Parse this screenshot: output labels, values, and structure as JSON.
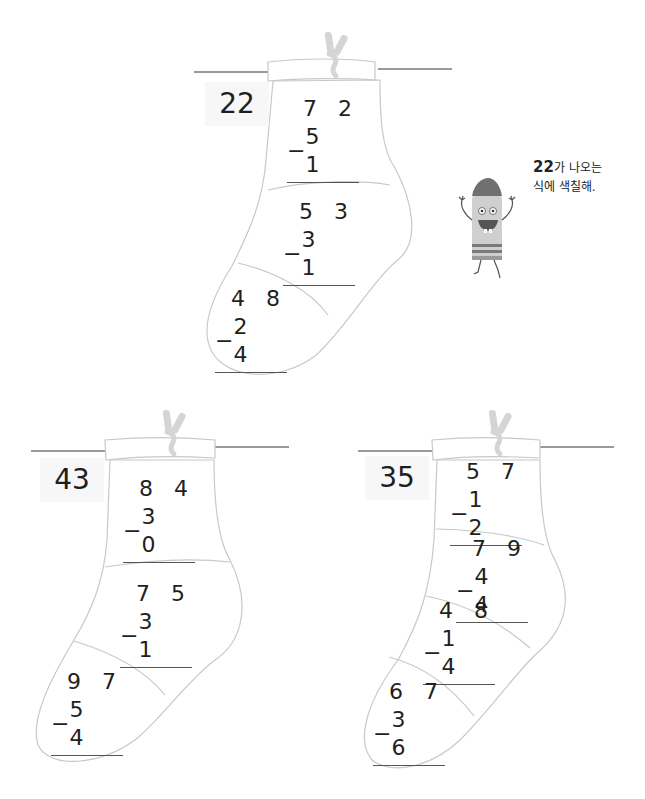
{
  "instruction": {
    "target": "22",
    "line1_suffix": "가 나오는",
    "line2": "식에 색칠해."
  },
  "stockings": [
    {
      "answer": "22",
      "problems": [
        {
          "minuend": "7 2",
          "operator": "−",
          "subtrahend": "5 1"
        },
        {
          "minuend": "5 3",
          "operator": "−",
          "subtrahend": "3 1"
        },
        {
          "minuend": "4 8",
          "operator": "−",
          "subtrahend": "2 4"
        }
      ]
    },
    {
      "answer": "43",
      "problems": [
        {
          "minuend": "8 4",
          "operator": "−",
          "subtrahend": "3 0"
        },
        {
          "minuend": "7 5",
          "operator": "−",
          "subtrahend": "3 1"
        },
        {
          "minuend": "9 7",
          "operator": "−",
          "subtrahend": "5 4"
        }
      ]
    },
    {
      "answer": "35",
      "problems": [
        {
          "minuend": "5 7",
          "operator": "−",
          "subtrahend": "1 2"
        },
        {
          "minuend": "7 9",
          "operator": "−",
          "subtrahend": "4 4"
        },
        {
          "minuend": "4 8",
          "operator": "−",
          "subtrahend": "1 4"
        },
        {
          "minuend": "6 7",
          "operator": "−",
          "subtrahend": "3 6"
        }
      ]
    }
  ],
  "colors": {
    "outline": "#c8c8c8",
    "clothesline": "#9a9a9a",
    "answer_bg": "#f7f7f7",
    "crayon_tip": "#707070",
    "crayon_body": "#c9c9c9"
  }
}
